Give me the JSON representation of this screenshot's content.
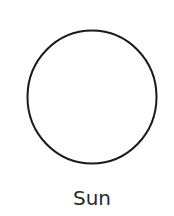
{
  "diagram": {
    "shape": {
      "type": "circle",
      "name": "sun-circle",
      "cx": 92,
      "cy": 97,
      "rx": 64.5,
      "ry": 66.5,
      "stroke": "#1a1a1a",
      "fill": "#ffffff",
      "stroke_width": 2
    },
    "label": "Sun"
  }
}
